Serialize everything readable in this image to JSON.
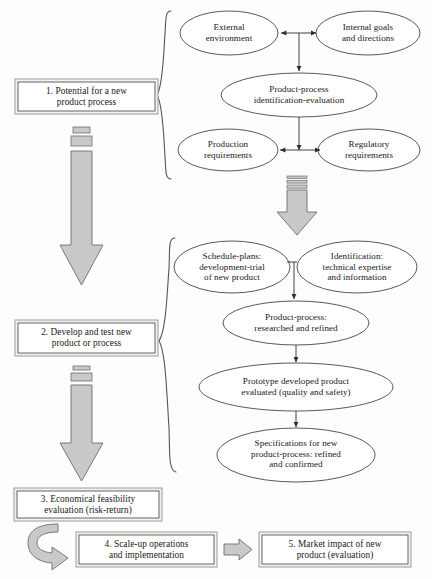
{
  "diagram": {
    "type": "flowchart",
    "colors": {
      "outline": "#3b3b3b",
      "arrow_fill": "#c9c9c9",
      "arrow_stroke": "#6e6e6e",
      "box_frame": "#b4b4b4",
      "box_fill": "#ffffff",
      "text": "#181818",
      "brace": "#555555"
    }
  },
  "stages": [
    {
      "id": "stage-1",
      "label": "1. Potential for a new\nproduct process"
    },
    {
      "id": "stage-2",
      "label": "2. Develop and test new\nproduct or process"
    },
    {
      "id": "stage-3",
      "label": "3. Economical feasibility\nevaluation (risk-return)"
    },
    {
      "id": "stage-4",
      "label": "4. Scale-up operations\nand implementation"
    },
    {
      "id": "stage-5",
      "label": "5. Market impact of new\nproduct (evaluation)"
    }
  ],
  "group_one": {
    "nodes": [
      {
        "id": "external-environment",
        "label": "External\nenvironment"
      },
      {
        "id": "internal-goals",
        "label": "Internal goals\nand directions"
      },
      {
        "id": "product-process-identification",
        "label": "Product-process\nidentification-evaluation"
      },
      {
        "id": "production-requirements",
        "label": "Production\nrequirements"
      },
      {
        "id": "regulatory-requirements",
        "label": "Regulatory\nrequirements"
      }
    ]
  },
  "group_two": {
    "nodes": [
      {
        "id": "schedule-plans",
        "label": "Schedule-plans:\ndevelopment-trial\nof new product"
      },
      {
        "id": "identification-expertise",
        "label": "Identification:\ntechnical expertise\nand information"
      },
      {
        "id": "product-process-researched",
        "label": "Product-process:\nresearched and refined"
      },
      {
        "id": "prototype-developed",
        "label": "Prototype developed product\nevaluated (quality and safety)"
      },
      {
        "id": "specifications-new",
        "label": "Specifications for new\nproduct-process: refined\nand confirmed"
      }
    ]
  },
  "connectors": [
    {
      "id": "arrow-stage1-to-stage2",
      "kind": "block-arrow-down-segmented"
    },
    {
      "id": "arrow-stage2-to-stage3",
      "kind": "block-arrow-down-segmented"
    },
    {
      "id": "arrow-group1-to-group2",
      "kind": "block-arrow-down-segmented"
    },
    {
      "id": "arrow-stage3-to-stage4",
      "kind": "curved-arrow"
    },
    {
      "id": "arrow-stage4-to-stage5",
      "kind": "block-arrow-right"
    },
    {
      "id": "brace-group-one",
      "kind": "curly-brace-left"
    },
    {
      "id": "brace-group-two",
      "kind": "curly-brace-left"
    },
    {
      "id": "link-external-internal",
      "kind": "double-headed-arrow"
    },
    {
      "id": "link-production-regulatory",
      "kind": "double-headed-arrow"
    },
    {
      "id": "link-top-to-identification",
      "kind": "arrow-down"
    },
    {
      "id": "link-identification-to-bottom",
      "kind": "arrow-down"
    },
    {
      "id": "link-schedule-to-researched",
      "kind": "arrow-down"
    },
    {
      "id": "link-researched-to-prototype",
      "kind": "arrow-down"
    },
    {
      "id": "link-prototype-to-specifications",
      "kind": "arrow-down"
    }
  ]
}
